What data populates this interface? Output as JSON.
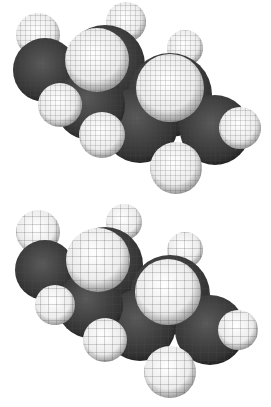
{
  "image": {
    "description": "Two space-filling wireframe mesh renderings of a butane molecule (C4H10) in different views",
    "background": "#ffffff",
    "colors": {
      "carbon": "#3a3a3a",
      "hydrogen": "#f4f4f4",
      "mesh": "#555555"
    },
    "models": [
      {
        "name": "fine-mesh-view",
        "atoms": {
          "carbon": 4,
          "hydrogen": 10
        }
      },
      {
        "name": "coarse-mesh-view",
        "atoms": {
          "carbon": 4,
          "hydrogen": 10
        }
      }
    ]
  }
}
